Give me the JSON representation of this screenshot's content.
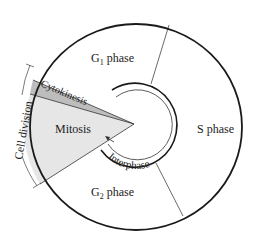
{
  "diagram": {
    "type": "cell-cycle",
    "colors": {
      "background": "#ffffff",
      "stroke": "#1a1a1a",
      "mitosis_fill": "#e6e6e6",
      "cytokinesis_fill": "#bdbdbd"
    },
    "labels": {
      "g1_main": "G",
      "g1_sub": "1",
      "g1_rest": " phase",
      "s_phase": "S phase",
      "g2_main": "G",
      "g2_sub": "2",
      "g2_rest": " phase",
      "mitosis": "Mitosis",
      "cytokinesis": "Cytokinesis",
      "interphase": "Interphase",
      "cell_division": "Cell division"
    }
  }
}
